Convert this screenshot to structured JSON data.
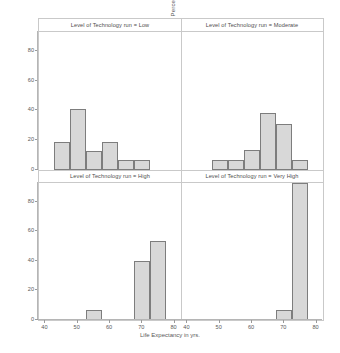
{
  "chart_data": {
    "type": "bar",
    "title": "",
    "xlabel": "Life Expectancy in yrs.",
    "ylabel": "Percent",
    "xlim": [
      38,
      82
    ],
    "ylim": [
      0,
      93
    ],
    "xticks": [
      40,
      50,
      60,
      70,
      80
    ],
    "yticks": [
      0,
      20,
      40,
      60,
      80
    ],
    "bin_width": 5,
    "grid": false,
    "legend": "none",
    "panel_variable": "Level of Technology run",
    "panels": [
      {
        "label": "Level of Technology run = Low",
        "key": "low",
        "row": 0,
        "col": 0,
        "bins": [
          {
            "start": 42.5,
            "end": 47.5,
            "center": 45,
            "value": 18.5
          },
          {
            "start": 47.5,
            "end": 52.5,
            "center": 50,
            "value": 41.2
          },
          {
            "start": 52.5,
            "end": 57.5,
            "center": 55,
            "value": 12.3
          },
          {
            "start": 57.5,
            "end": 62.5,
            "center": 60,
            "value": 18.5
          },
          {
            "start": 62.5,
            "end": 67.5,
            "center": 65,
            "value": 6.2
          },
          {
            "start": 67.5,
            "end": 72.5,
            "center": 70,
            "value": 6.2
          }
        ]
      },
      {
        "label": "Level of Technology run = Moderate",
        "key": "moderate",
        "row": 0,
        "col": 1,
        "bins": [
          {
            "start": 47.5,
            "end": 52.5,
            "center": 50,
            "value": 6.5
          },
          {
            "start": 52.5,
            "end": 57.5,
            "center": 55,
            "value": 6.5
          },
          {
            "start": 57.5,
            "end": 62.5,
            "center": 60,
            "value": 13.0
          },
          {
            "start": 62.5,
            "end": 67.5,
            "center": 65,
            "value": 38.0
          },
          {
            "start": 67.5,
            "end": 72.5,
            "center": 70,
            "value": 31.0
          },
          {
            "start": 72.5,
            "end": 77.5,
            "center": 75,
            "value": 6.5
          }
        ]
      },
      {
        "label": "Level of Technology run = High",
        "key": "high",
        "row": 1,
        "col": 0,
        "bins": [
          {
            "start": 52.5,
            "end": 57.5,
            "center": 55,
            "value": 6.7
          },
          {
            "start": 67.5,
            "end": 72.5,
            "center": 70,
            "value": 40.0
          },
          {
            "start": 72.5,
            "end": 77.5,
            "center": 75,
            "value": 53.3
          }
        ]
      },
      {
        "label": "Level of Technology run = Very High",
        "key": "very_high",
        "row": 1,
        "col": 1,
        "bins": [
          {
            "start": 67.5,
            "end": 72.5,
            "center": 70,
            "value": 7.0
          },
          {
            "start": 72.5,
            "end": 77.5,
            "center": 75,
            "value": 93.0
          }
        ]
      }
    ],
    "colors": {
      "bar_fill": "#d8d8d8",
      "bar_border": "#7d7d7d",
      "frame": "#c9c9c9",
      "text": "#555555",
      "background": "#ffffff"
    }
  }
}
